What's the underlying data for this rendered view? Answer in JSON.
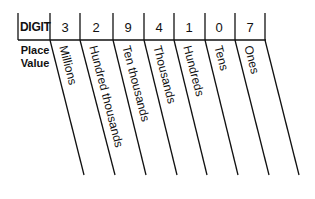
{
  "diagram": {
    "row_header": "DIGIT",
    "column_header": "Place Value",
    "column_header_lines": [
      "Place",
      "Value"
    ],
    "number": "3294107",
    "columns": [
      {
        "digit": "3",
        "place": "Millions"
      },
      {
        "digit": "2",
        "place": "Hundred thousands"
      },
      {
        "digit": "9",
        "place": "Ten thousands"
      },
      {
        "digit": "4",
        "place": "Thousands"
      },
      {
        "digit": "1",
        "place": "Hundreds"
      },
      {
        "digit": "0",
        "place": "Tens"
      },
      {
        "digit": "7",
        "place": "Ones"
      }
    ],
    "line_color": "#111111"
  }
}
